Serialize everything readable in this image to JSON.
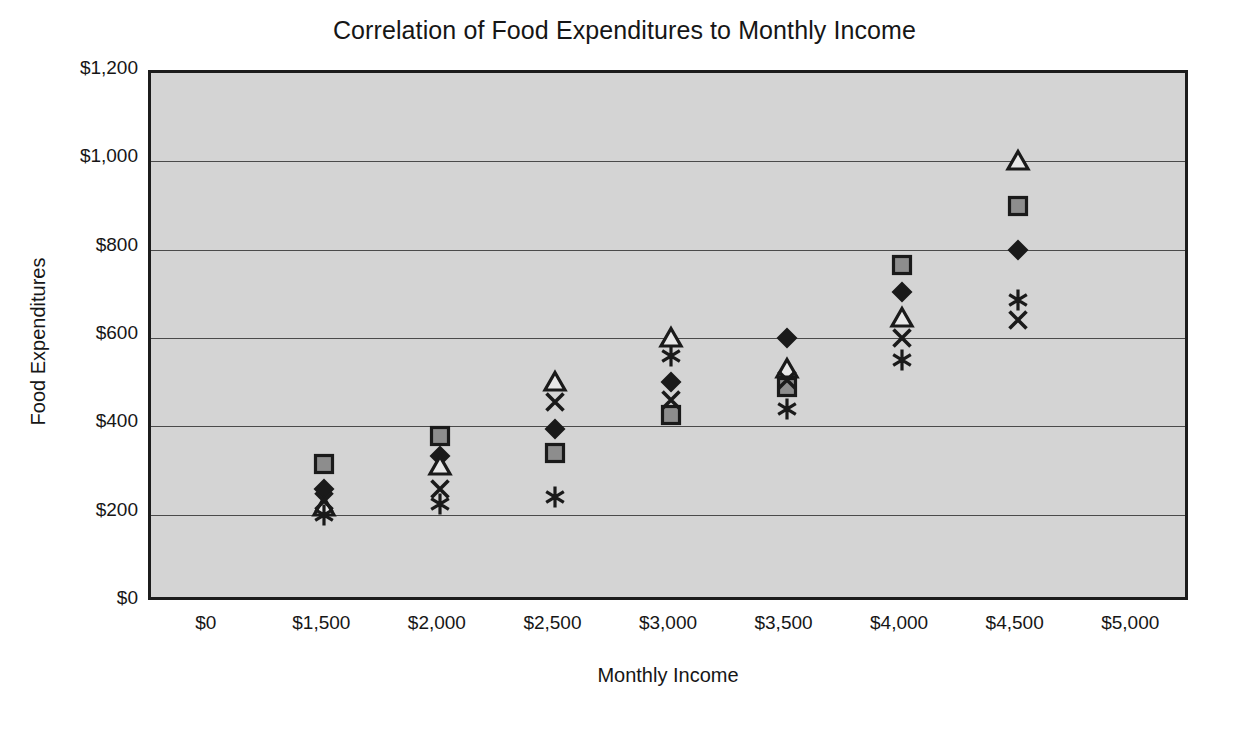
{
  "chart_data": {
    "type": "scatter",
    "title": "Correlation of Food Expenditures to Monthly Income",
    "xlabel": "Monthly Income",
    "ylabel": "Food Expenditures",
    "grid": true,
    "legend": "none",
    "plot_background_color": "#d4d4d4",
    "plot_border_color": "#1c1c1c",
    "gridline_color": "#4a4a4a",
    "ylim": [
      0,
      1200
    ],
    "ytick_step": 200,
    "ytick_labels": [
      "$0",
      "$200",
      "$400",
      "$600",
      "$800",
      "$1,000",
      "$1,200"
    ],
    "ytick_values": [
      0,
      200,
      400,
      600,
      800,
      1000,
      1200
    ],
    "xtick_labels": [
      "$0",
      "$1,500",
      "$2,000",
      "$2,500",
      "$3,000",
      "$3,500",
      "$4,000",
      "$4,500",
      "$5,000"
    ],
    "xtick_values": [
      0,
      1500,
      2000,
      2500,
      3000,
      3500,
      4000,
      4500,
      5000
    ],
    "categories": [
      1500,
      2000,
      2500,
      3000,
      3500,
      4000,
      4500
    ],
    "category_labels": [
      "$1,500",
      "$2,000",
      "$2,500",
      "$3,000",
      "$3,500",
      "$4,000",
      "$4,500"
    ],
    "series": [
      {
        "name": "Series 1",
        "marker": "diamond-filled",
        "values": [
          258,
          332,
          395,
          500,
          600,
          705,
          800
        ]
      },
      {
        "name": "Series 2",
        "marker": "square-filled",
        "values": [
          315,
          378,
          340,
          425,
          490,
          765,
          900
        ]
      },
      {
        "name": "Series 3",
        "marker": "triangle-hollow",
        "values": [
          218,
          310,
          500,
          600,
          530,
          645,
          1000
        ]
      },
      {
        "name": "Series 4",
        "marker": "x-cross",
        "values": [
          230,
          258,
          455,
          460,
          505,
          600,
          640
        ]
      },
      {
        "name": "Series 5",
        "marker": "asterisk",
        "values": [
          200,
          225,
          240,
          560,
          440,
          550,
          685
        ]
      }
    ]
  }
}
